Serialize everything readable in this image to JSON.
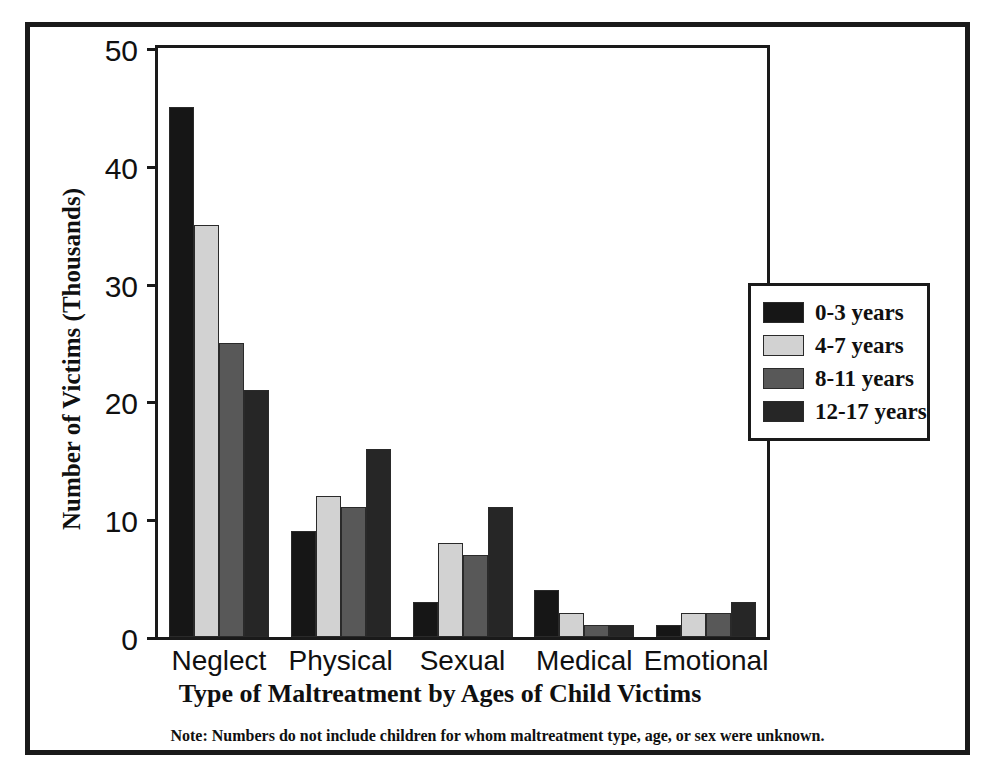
{
  "chart_data": {
    "type": "bar",
    "title": "",
    "xlabel": "Type of Maltreatment by Ages of Child Victims",
    "ylabel": "Number of Victims (Thousands)",
    "categories": [
      "Neglect",
      "Physical",
      "Sexual",
      "Medical",
      "Emotional"
    ],
    "series": [
      {
        "name": "0-3 years",
        "color": "#161616",
        "values": [
          45,
          9,
          3,
          4,
          1
        ]
      },
      {
        "name": "4-7 years",
        "color": "#d2d2d2",
        "values": [
          35,
          12,
          8,
          2,
          2
        ]
      },
      {
        "name": "8-11 years",
        "color": "#585858",
        "values": [
          25,
          11,
          7,
          1,
          2
        ]
      },
      {
        "name": "12-17 years",
        "color": "#262626",
        "values": [
          21,
          16,
          11,
          1,
          3
        ]
      }
    ],
    "ylim": [
      0,
      50
    ],
    "yticks": [
      0,
      10,
      20,
      30,
      40,
      50
    ],
    "ytick_labels": [
      "0",
      "10",
      "20",
      "30",
      "40",
      "50"
    ],
    "grid": false,
    "legend_position": "right"
  },
  "footnote": {
    "text": "Note: Numbers do not include children for whom maltreatment type, age, or sex were unknown."
  },
  "colors": {
    "frame": "#1a1a1a",
    "axis": "#1a1a1a",
    "text": "#101010",
    "background": "#ffffff"
  }
}
